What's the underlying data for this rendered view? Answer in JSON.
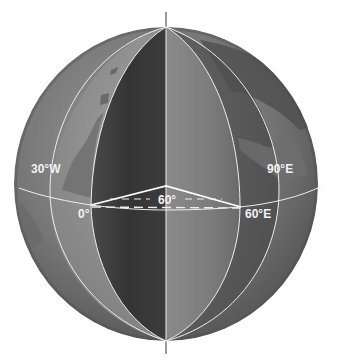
{
  "diagram": {
    "type": "globe-longitude-diagram",
    "axis_line": true,
    "labels": {
      "meridian_30w": "30°W",
      "meridian_0": "0°",
      "meridian_60e": "60°E",
      "meridian_90e": "90°E",
      "angle": "60°"
    },
    "meridians": [
      {
        "name": "30°W",
        "x_at_equator": 50
      },
      {
        "name": "0°",
        "x_at_equator": 91
      },
      {
        "name": "central",
        "x_at_equator": 166
      },
      {
        "name": "60°E",
        "x_at_equator": 240
      },
      {
        "name": "90°E",
        "x_at_equator": 279
      }
    ],
    "colors": {
      "background": "#ffffff",
      "globe_light": "#a8a8a8",
      "globe_mid": "#7a7a7a",
      "globe_dark": "#3e3e3e",
      "land": "#8c8c8c",
      "lines": "#f0f0f0",
      "axis": "#555555"
    }
  }
}
